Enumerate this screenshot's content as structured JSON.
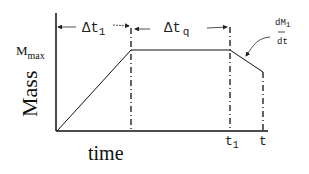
{
  "diagram": {
    "y_axis_label": "Mass",
    "x_axis_label": "time",
    "y_marker": {
      "main": "M",
      "sub": "max"
    },
    "intervals": [
      {
        "symbol": "Δt",
        "sub": "1"
      },
      {
        "symbol": "Δt",
        "sub": "q"
      }
    ],
    "x_ticks": [
      {
        "main": "t",
        "sub": "1"
      },
      {
        "main": "t",
        "sub": ""
      }
    ],
    "rate_annotation": {
      "numerator_main": "dM",
      "numerator_sub": "1",
      "denominator": "dt"
    },
    "curve_points": [
      [
        57,
        131
      ],
      [
        131,
        50
      ],
      [
        230,
        50
      ],
      [
        263,
        72
      ]
    ]
  }
}
